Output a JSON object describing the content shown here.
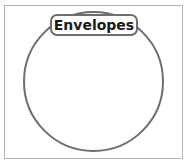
{
  "diagram": {
    "type": "venn-single-set",
    "set_label": "Envelopes",
    "colors": {
      "frame_border": "#b4b4b4",
      "circle_stroke": "#6e6e6e",
      "label_text": "#1a1a1a",
      "background": "#ffffff"
    }
  }
}
